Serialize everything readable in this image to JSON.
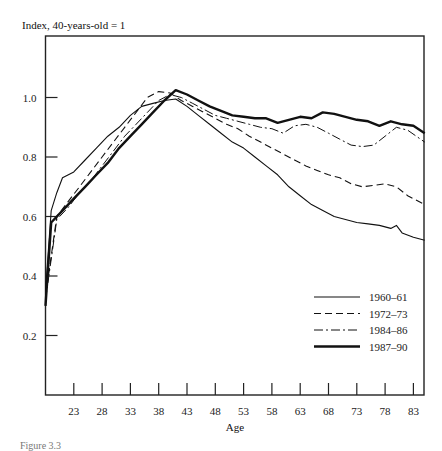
{
  "chart_data": {
    "type": "line",
    "title": "",
    "ylabel": "Index, 40-years-old = 1",
    "xlabel": "Age",
    "xlim": [
      18,
      85
    ],
    "ylim": [
      0,
      1.2
    ],
    "grid": false,
    "legend_position": "lower right (inside)",
    "x_ticks": [
      23,
      28,
      33,
      38,
      43,
      48,
      53,
      58,
      63,
      68,
      73,
      78,
      83
    ],
    "y_ticks": [
      0.2,
      0.4,
      0.6,
      0.8,
      1.0
    ],
    "y_tick_labels": [
      "0.2",
      "0.4",
      "0.6",
      "0.8",
      "1.0"
    ],
    "series": [
      {
        "name": "1960–61",
        "style": "solid-thin",
        "x": [
          18,
          19,
          20,
          21,
          23,
          25,
          27,
          29,
          31,
          33,
          35,
          37,
          39,
          41,
          43,
          45,
          47,
          49,
          51,
          53,
          55,
          57,
          59,
          61,
          63,
          65,
          67,
          69,
          71,
          73,
          75,
          77,
          79,
          80,
          81,
          83,
          85
        ],
        "values": [
          0.35,
          0.62,
          0.68,
          0.73,
          0.75,
          0.79,
          0.83,
          0.87,
          0.9,
          0.94,
          0.97,
          0.98,
          0.99,
          0.995,
          0.97,
          0.94,
          0.91,
          0.88,
          0.85,
          0.83,
          0.8,
          0.77,
          0.74,
          0.7,
          0.67,
          0.64,
          0.62,
          0.6,
          0.59,
          0.58,
          0.575,
          0.57,
          0.56,
          0.57,
          0.545,
          0.53,
          0.52
        ]
      },
      {
        "name": "1972–73",
        "style": "dashed",
        "x": [
          18,
          20,
          22,
          24,
          26,
          28,
          30,
          32,
          34,
          36,
          38,
          40,
          42,
          44,
          46,
          48,
          50,
          52,
          54,
          56,
          58,
          60,
          62,
          64,
          66,
          68,
          70,
          72,
          74,
          76,
          78,
          80,
          82,
          85
        ],
        "values": [
          0.33,
          0.6,
          0.65,
          0.7,
          0.75,
          0.8,
          0.85,
          0.9,
          0.95,
          1.0,
          1.02,
          1.015,
          0.99,
          0.97,
          0.95,
          0.93,
          0.91,
          0.895,
          0.87,
          0.85,
          0.83,
          0.81,
          0.79,
          0.77,
          0.755,
          0.74,
          0.73,
          0.71,
          0.7,
          0.705,
          0.71,
          0.7,
          0.67,
          0.64
        ]
      },
      {
        "name": "1984–86",
        "style": "dash-dot",
        "x": [
          18,
          20,
          22,
          24,
          26,
          28,
          30,
          32,
          34,
          36,
          38,
          40,
          42,
          44,
          46,
          48,
          50,
          52,
          54,
          56,
          58,
          60,
          62,
          64,
          66,
          68,
          70,
          72,
          74,
          76,
          78,
          80,
          82,
          85
        ],
        "values": [
          0.32,
          0.59,
          0.63,
          0.68,
          0.72,
          0.77,
          0.82,
          0.87,
          0.91,
          0.95,
          0.99,
          1.01,
          1.0,
          0.98,
          0.96,
          0.94,
          0.93,
          0.92,
          0.91,
          0.9,
          0.895,
          0.88,
          0.905,
          0.91,
          0.9,
          0.88,
          0.86,
          0.84,
          0.835,
          0.84,
          0.87,
          0.9,
          0.89,
          0.85
        ]
      },
      {
        "name": "1987–90",
        "style": "solid-thick",
        "x": [
          18,
          19,
          21,
          23,
          25,
          27,
          29,
          31,
          33,
          35,
          37,
          39,
          41,
          43,
          45,
          47,
          49,
          51,
          53,
          55,
          57,
          59,
          61,
          63,
          65,
          67,
          69,
          71,
          73,
          75,
          77,
          79,
          81,
          83,
          85
        ],
        "values": [
          0.3,
          0.58,
          0.62,
          0.66,
          0.7,
          0.74,
          0.78,
          0.83,
          0.87,
          0.91,
          0.95,
          0.99,
          1.025,
          1.01,
          0.99,
          0.97,
          0.955,
          0.94,
          0.935,
          0.93,
          0.93,
          0.915,
          0.925,
          0.935,
          0.93,
          0.95,
          0.945,
          0.935,
          0.925,
          0.92,
          0.905,
          0.92,
          0.91,
          0.905,
          0.88
        ]
      }
    ]
  },
  "labels": {
    "y_axis_title": "Index, 40-years-old = 1",
    "x_axis_title": "Age",
    "caption": "Figure 3.3"
  },
  "legend": [
    {
      "label": "1960–61"
    },
    {
      "label": "1972–73"
    },
    {
      "label": "1984–86"
    },
    {
      "label": "1987–90"
    }
  ]
}
